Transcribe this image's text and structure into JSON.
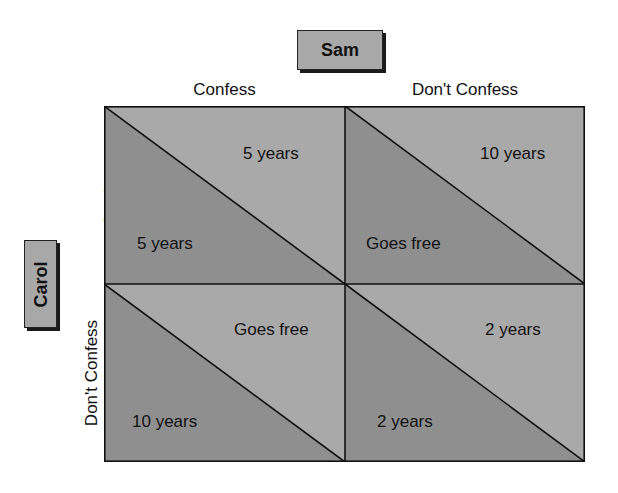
{
  "players": {
    "column": "Sam",
    "row": "Carol"
  },
  "strategies": {
    "columns": [
      "Confess",
      "Don't Confess"
    ],
    "rows": [
      "Confess",
      "Don't Confess"
    ]
  },
  "colors": {
    "lower_triangle": "#8f8f8f",
    "upper_triangle": "#a9a9a9",
    "lines": "#111111",
    "label_box": "#a8a8a8"
  },
  "cells": [
    {
      "row": "Confess",
      "col": "Confess",
      "sam": "5 years",
      "carol": "5 years"
    },
    {
      "row": "Confess",
      "col": "Don't Confess",
      "sam": "10 years",
      "carol": "Goes free"
    },
    {
      "row": "Don't Confess",
      "col": "Confess",
      "sam": "Goes free",
      "carol": "10 years"
    },
    {
      "row": "Don't Confess",
      "col": "Don't Confess",
      "sam": "2 years",
      "carol": "2 years"
    }
  ]
}
